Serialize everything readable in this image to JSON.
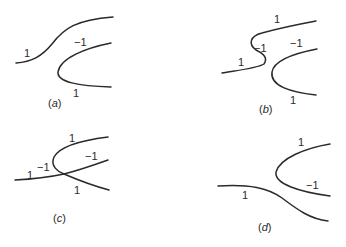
{
  "figure": {
    "panels": [
      {
        "id": "a",
        "caption_open": "(",
        "caption_letter": "a",
        "caption_close": ")",
        "labels": [
          "1",
          "−1",
          "1"
        ]
      },
      {
        "id": "b",
        "caption_open": "(",
        "caption_letter": "b",
        "caption_close": ")",
        "labels": [
          "1",
          "−1",
          "1",
          "−1",
          "1"
        ]
      },
      {
        "id": "c",
        "caption_open": "(",
        "caption_letter": "c",
        "caption_close": ")",
        "labels": [
          "1",
          "−1",
          "−1",
          "1",
          "1"
        ]
      },
      {
        "id": "d",
        "caption_open": "(",
        "caption_letter": "d",
        "caption_close": ")",
        "labels": [
          "1",
          "−1",
          "1"
        ]
      }
    ]
  }
}
